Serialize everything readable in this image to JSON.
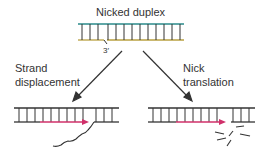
{
  "title": "Nicked duplex",
  "nick_label": "3′",
  "left_branch": {
    "line1": "Strand",
    "line2": "displacement"
  },
  "right_branch": {
    "line1": "Nick",
    "line2": "translation"
  },
  "colors": {
    "top_strand": "#2a8a8a",
    "bottom_strand": "#b8a040",
    "new_strand": "#d0306a",
    "dna": "#333333"
  }
}
